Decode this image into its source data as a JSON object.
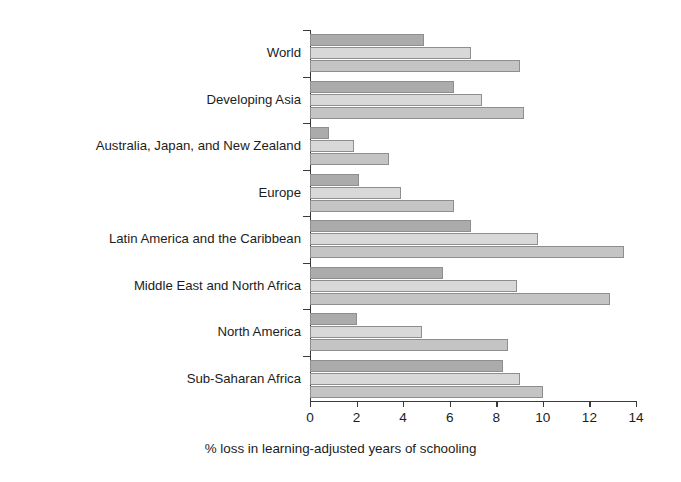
{
  "chart_data": {
    "type": "bar",
    "orientation": "horizontal",
    "title": "",
    "xlabel": "% loss in learning-adjusted years of schooling",
    "ylabel": "",
    "xlim": [
      0,
      14
    ],
    "xticks": [
      "0",
      "2",
      "4",
      "6",
      "8",
      "10",
      "12",
      "14"
    ],
    "grid": false,
    "legend": "none",
    "categories": [
      "World",
      "Developing Asia",
      "Australia, Japan, and New Zealand",
      "Europe",
      "Latin America and the Caribbean",
      "Middle East and North Africa",
      "North America",
      "Sub-Saharan Africa"
    ],
    "series": [
      {
        "name": "series-1",
        "color": "#ababab",
        "values": [
          4.9,
          6.2,
          0.8,
          2.1,
          6.9,
          5.7,
          2.0,
          8.3
        ]
      },
      {
        "name": "series-2",
        "color": "#d8d8d8",
        "values": [
          6.9,
          7.4,
          1.9,
          3.9,
          9.8,
          8.9,
          4.8,
          9.0
        ]
      },
      {
        "name": "series-3",
        "color": "#c4c4c4",
        "values": [
          9.0,
          9.2,
          3.4,
          6.2,
          13.5,
          12.9,
          8.5,
          10.0
        ]
      }
    ]
  }
}
